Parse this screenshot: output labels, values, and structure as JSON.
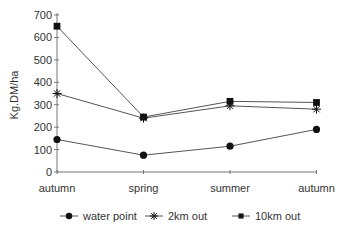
{
  "chart_data": {
    "type": "line",
    "title": "",
    "xlabel": "",
    "ylabel": "Kg.DM/ha",
    "ylim": [
      0,
      700
    ],
    "yticks": [
      0,
      100,
      200,
      300,
      400,
      500,
      600,
      700
    ],
    "categories": [
      "autumn",
      "spring",
      "summer",
      "autumn"
    ],
    "grid": false,
    "legend_position": "bottom",
    "series": [
      {
        "name": "water point",
        "marker": "circle",
        "values": [
          145,
          75,
          115,
          190
        ]
      },
      {
        "name": "2km out",
        "marker": "asterisk",
        "values": [
          350,
          240,
          295,
          280
        ]
      },
      {
        "name": "10km out",
        "marker": "square",
        "values": [
          650,
          245,
          315,
          310
        ]
      }
    ],
    "colors": {
      "line": "#555555",
      "marker": "#111111",
      "axis": "#777777"
    }
  }
}
